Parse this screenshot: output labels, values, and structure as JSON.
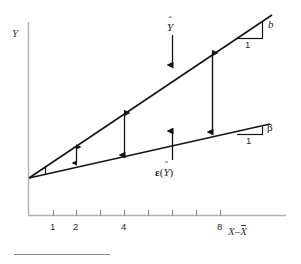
{
  "figure": {
    "type": "line-diagram",
    "axes": {
      "y_label": "Y",
      "x_label_prefix": "X",
      "x_label_minus": "–",
      "x_label_bar": "X",
      "x_ticks": [
        {
          "value": "1",
          "labeled": true
        },
        {
          "value": "2",
          "labeled": true
        },
        {
          "value": "",
          "labeled": false
        },
        {
          "value": "4",
          "labeled": true
        },
        {
          "value": "",
          "labeled": false
        },
        {
          "value": "",
          "labeled": false
        },
        {
          "value": "",
          "labeled": false
        },
        {
          "value": "8",
          "labeled": true
        }
      ]
    },
    "lines": [
      {
        "name": "y-hat-line",
        "label": "Y",
        "hat": "ˆ",
        "slope_label": "b"
      },
      {
        "name": "expected-y-line",
        "label": "ε(Y)",
        "slope_label": "β"
      }
    ],
    "slope_triangles": [
      {
        "name": "b-triangle",
        "rise_label": "b",
        "run_label": "1"
      },
      {
        "name": "beta-triangle",
        "rise_label": "β",
        "run_label": "1"
      }
    ],
    "callouts": [
      {
        "name": "y-hat-callout",
        "text": "Y",
        "hat": "ˆ"
      },
      {
        "name": "expected-y-callout",
        "epsilon": "ε",
        "open": "(",
        "inner": "Y",
        "hat": "ˆ",
        "close": ")"
      }
    ],
    "deviation_arrows": [
      {
        "at_tick": "1",
        "size": "small"
      },
      {
        "at_tick": "2",
        "size": "small"
      },
      {
        "at_tick": "4",
        "size": "medium"
      },
      {
        "at_tick": "8",
        "size": "large"
      }
    ],
    "colors": {
      "axis": "#aaaaaa",
      "line": "#1a1a1a",
      "text": "#1a1a1a",
      "rule": "#8c8c8c",
      "background": "#ffffff"
    }
  }
}
